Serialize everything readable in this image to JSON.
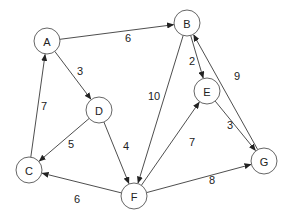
{
  "diagram": {
    "type": "directed-weighted-graph",
    "node_radius": 13,
    "nodes": [
      {
        "id": "A",
        "label": "A",
        "x": 47,
        "y": 41
      },
      {
        "id": "B",
        "label": "B",
        "x": 187,
        "y": 23
      },
      {
        "id": "C",
        "label": "C",
        "x": 29,
        "y": 170
      },
      {
        "id": "D",
        "label": "D",
        "x": 99,
        "y": 110
      },
      {
        "id": "E",
        "label": "E",
        "x": 207,
        "y": 91
      },
      {
        "id": "F",
        "label": "F",
        "x": 134,
        "y": 196
      },
      {
        "id": "G",
        "label": "G",
        "x": 264,
        "y": 161
      }
    ],
    "edges": [
      {
        "from": "A",
        "to": "B",
        "weight": "6",
        "lx": 128,
        "ly": 38
      },
      {
        "from": "A",
        "to": "D",
        "weight": "3",
        "lx": 80,
        "ly": 71
      },
      {
        "from": "C",
        "to": "A",
        "weight": "7",
        "lx": 44,
        "ly": 106
      },
      {
        "from": "D",
        "to": "C",
        "weight": "5",
        "lx": 71,
        "ly": 144
      },
      {
        "from": "D",
        "to": "F",
        "weight": "4",
        "lx": 126,
        "ly": 146
      },
      {
        "from": "F",
        "to": "C",
        "weight": "6",
        "lx": 77,
        "ly": 199
      },
      {
        "from": "B",
        "to": "F",
        "weight": "10",
        "lx": 154,
        "ly": 96
      },
      {
        "from": "B",
        "to": "E",
        "weight": "2",
        "lx": 192,
        "ly": 61
      },
      {
        "from": "E",
        "to": "G",
        "weight": "3",
        "lx": 230,
        "ly": 125
      },
      {
        "from": "G",
        "to": "B",
        "weight": "9",
        "lx": 237,
        "ly": 76
      },
      {
        "from": "F",
        "to": "E",
        "weight": "7",
        "lx": 192,
        "ly": 142
      },
      {
        "from": "F",
        "to": "G",
        "weight": "8",
        "lx": 212,
        "ly": 180
      }
    ],
    "colors": {
      "edge": "#3a3a3a",
      "node_stroke": "#555555",
      "node_fill": "#ffffff",
      "text": "#222222",
      "background": "#ffffff"
    }
  }
}
